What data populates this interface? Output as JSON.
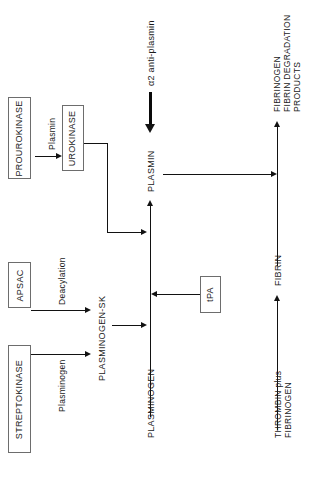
{
  "diagram": {
    "orientation": "rotated-90-ccw",
    "colors": {
      "background": "#ffffff",
      "stroke": "#121212",
      "box_border": "#6d6d6d",
      "text": "#1a1a1a"
    },
    "boxes": [
      {
        "id": "prourokinase",
        "label": "PROUROKINASE"
      },
      {
        "id": "urokinase",
        "label": "UROKINASE"
      },
      {
        "id": "apsac",
        "label": "APSAC"
      },
      {
        "id": "streptokinase",
        "label": "STREPTOKINASE"
      },
      {
        "id": "tpa",
        "label": "tPA"
      }
    ],
    "nodes": [
      {
        "id": "plasmin",
        "label": "PLASMIN"
      },
      {
        "id": "plasminogen_sk",
        "label": "PLASMINOGEN-SK"
      },
      {
        "id": "plasminogen",
        "label": "PLASMINOGEN"
      },
      {
        "id": "fibrin",
        "label": "FIBRIN"
      },
      {
        "id": "thrombin_fibrinogen",
        "label": "THROMBIN plus\nFIBRINOGEN",
        "line1": "THROMBIN plus",
        "line2": "FIBRINOGEN"
      },
      {
        "id": "fdp",
        "label": "FIBRINOGEN\nFIBRIN DEGRADATION\nPRODUCTS",
        "line1": "FIBRINOGEN",
        "line2": "FIBRIN DEGRADATION",
        "line3": "PRODUCTS"
      }
    ],
    "edge_labels": [
      {
        "id": "plasmin_catalyst",
        "label": "Plasmin"
      },
      {
        "id": "deacylation",
        "label": "Deacylation"
      },
      {
        "id": "plasminogen_substrate",
        "label": "Plasminogen"
      },
      {
        "id": "a2_antiplasmin",
        "label": "α2 anti-plasmin"
      }
    ]
  }
}
